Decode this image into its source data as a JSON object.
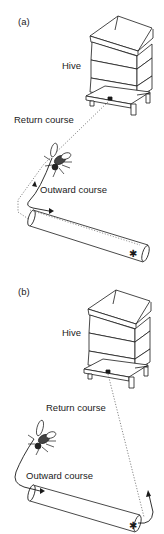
{
  "figure": {
    "panels": [
      {
        "id": "a",
        "letter": "(a)",
        "hive_label": "Hive",
        "return_label": "Return course",
        "outward_label": "Outward course"
      },
      {
        "id": "b",
        "letter": "(b)",
        "hive_label": "Hive",
        "return_label": "Return course",
        "outward_label": "Outward course"
      }
    ],
    "icons": {
      "hive": "beehive-icon",
      "bee": "bee-icon",
      "tube": "tunnel-tube",
      "food": "asterisk-food-source"
    },
    "colors": {
      "line": "#1a1a1a",
      "dotted": "#555555",
      "background": "#ffffff"
    }
  }
}
